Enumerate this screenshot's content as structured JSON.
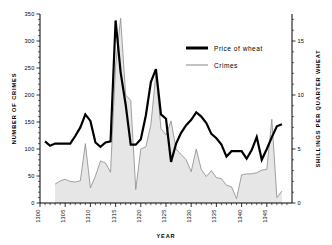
{
  "chart_data": {
    "type": "line",
    "title": "",
    "xlabel": "YEAR",
    "ylabel": "NUMBER OF CRIMES",
    "ylabel_right": "SHILLINGS PER QUARTER WHEAT",
    "xlim": [
      1300,
      1350
    ],
    "ylim": [
      0,
      350
    ],
    "ylim_right": [
      0,
      17.5
    ],
    "grid": false,
    "legend_position": "upper-right",
    "xticks": [
      1300,
      1305,
      1310,
      1315,
      1320,
      1325,
      1330,
      1335,
      1340,
      1345
    ],
    "xticklabels": [
      "1300",
      "1305",
      "1310",
      "1315",
      "1320",
      "1325",
      "1330",
      "1335",
      "1340",
      "1345"
    ],
    "yticks": [
      0,
      50,
      100,
      150,
      200,
      250,
      300,
      350
    ],
    "yticklabels": [
      "0",
      "50",
      "100",
      "150",
      "200",
      "250",
      "300",
      "350"
    ],
    "yticks_right": [
      0,
      5,
      10,
      15
    ],
    "yticklabels_right": [
      "0",
      "5",
      "10",
      "15"
    ],
    "series": [
      {
        "name": "Price of wheat",
        "axis": "right",
        "unit": "shillings per quarter",
        "color": "#000000",
        "x": [
          1301,
          1302,
          1303,
          1304,
          1305,
          1306,
          1307,
          1308,
          1309,
          1310,
          1311,
          1312,
          1313,
          1314,
          1315,
          1316,
          1317,
          1318,
          1319,
          1320,
          1321,
          1322,
          1323,
          1324,
          1325,
          1326,
          1327,
          1328,
          1329,
          1330,
          1331,
          1332,
          1333,
          1334,
          1335,
          1336,
          1337,
          1338,
          1339,
          1340,
          1341,
          1342,
          1343,
          1344,
          1345,
          1346,
          1347,
          1348
        ],
        "values": [
          5.7,
          5.3,
          5.5,
          5.5,
          5.5,
          5.5,
          6.2,
          7.0,
          8.2,
          7.6,
          5.6,
          5.2,
          5.6,
          5.7,
          16.9,
          12.1,
          9.1,
          5.4,
          5.4,
          5.9,
          8.1,
          11.2,
          12.4,
          8.2,
          7.8,
          3.8,
          5.5,
          6.5,
          7.2,
          7.7,
          8.4,
          8.0,
          7.4,
          6.4,
          6.0,
          5.4,
          4.3,
          4.8,
          4.8,
          4.8,
          4.1,
          4.9,
          6.1,
          4.0,
          5.0,
          6.1,
          7.1,
          7.3
        ]
      },
      {
        "name": "Crimes",
        "axis": "left",
        "unit": "number of crimes",
        "color": "#8a8a8a",
        "x": [
          1303,
          1304,
          1305,
          1306,
          1307,
          1308,
          1309,
          1310,
          1311,
          1312,
          1313,
          1314,
          1315,
          1316,
          1317,
          1318,
          1319,
          1320,
          1321,
          1322,
          1323,
          1324,
          1325,
          1326,
          1327,
          1328,
          1329,
          1330,
          1331,
          1332,
          1333,
          1334,
          1335,
          1336,
          1337,
          1338,
          1339,
          1340,
          1341,
          1342,
          1343,
          1344,
          1345,
          1346,
          1347,
          1348
        ],
        "values": [
          35,
          41,
          44,
          40,
          39,
          41,
          110,
          28,
          50,
          78,
          74,
          57,
          255,
          342,
          200,
          190,
          25,
          100,
          104,
          145,
          240,
          138,
          126,
          152,
          100,
          90,
          80,
          58,
          100,
          62,
          49,
          60,
          47,
          45,
          33,
          30,
          8,
          52,
          54,
          54,
          56,
          61,
          62,
          155,
          10,
          22
        ]
      }
    ],
    "legend": [
      {
        "label": "Price of wheat",
        "style": "thick-black-line"
      },
      {
        "label": "Crimes",
        "style": "thin-gray-line"
      }
    ]
  },
  "axes": {
    "left_title": "NUMBER  OF  CRIMES",
    "right_title": "SHILLINGS  PER  QUARTER  WHEAT",
    "bottom_title": "YEAR"
  }
}
